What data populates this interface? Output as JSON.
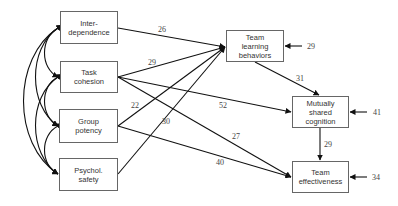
{
  "diagram": {
    "type": "path-model",
    "nodes": {
      "interdependence": {
        "line1": "Inter-",
        "line2": "dependence",
        "line3": ""
      },
      "task_cohesion": {
        "line1": "Task",
        "line2": "cohesion",
        "line3": ""
      },
      "group_potency": {
        "line1": "Group",
        "line2": "potency",
        "line3": ""
      },
      "psychol_safety": {
        "line1": "Psychol.",
        "line2": "safety",
        "line3": ""
      },
      "team_learning": {
        "line1": "Team",
        "line2": "learning",
        "line3": "behaviors"
      },
      "shared_cognition": {
        "line1": "Mutually",
        "line2": "shared",
        "line3": "cognition"
      },
      "team_effectiveness": {
        "line1": "Team",
        "line2": "effectiveness",
        "line3": ""
      }
    },
    "paths": {
      "interdependence_to_learning": "26",
      "task_cohesion_to_learning": "29",
      "group_potency_to_learning": "22",
      "psychol_safety_to_learning": "30",
      "task_cohesion_to_cognition": "52",
      "task_cohesion_to_effectiveness": "27",
      "group_potency_to_effectiveness": "40",
      "learning_to_cognition": "31",
      "cognition_to_effectiveness": "29"
    },
    "residuals": {
      "team_learning": "29",
      "shared_cognition": "41",
      "team_effectiveness": "34"
    },
    "colors": {
      "line": "#111111",
      "box_border": "#666666",
      "text": "#333333"
    }
  }
}
